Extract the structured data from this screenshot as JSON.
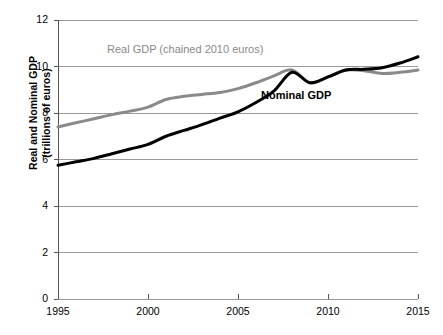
{
  "chart_data": {
    "type": "line",
    "title": "",
    "xlabel": "",
    "ylabel": "Real and Nominal GDP (trillions of euros)",
    "ylabel_line1": "Real and Nominal GDP",
    "ylabel_line2": "(trillions of euros)",
    "xlim": [
      1995,
      2015
    ],
    "ylim": [
      0,
      12
    ],
    "yticks": [
      0,
      2,
      4,
      6,
      8,
      10,
      12
    ],
    "ytick_labels": [
      "0",
      "2",
      "4",
      "6",
      "8",
      "10",
      "12"
    ],
    "xticks": [
      1995,
      2000,
      2005,
      2010,
      2015
    ],
    "xtick_labels": [
      "1995",
      "2000",
      "2005",
      "2010",
      "2015"
    ],
    "grid": "horizontal",
    "legend_position": "inline-annotations",
    "x": [
      1995,
      1996,
      1997,
      1998,
      1999,
      2000,
      2001,
      2002,
      2003,
      2004,
      2005,
      2006,
      2007,
      2008,
      2009,
      2010,
      2011,
      2012,
      2013,
      2014,
      2015
    ],
    "series": [
      {
        "name": "Real GDP (chained 2010 euros)",
        "color": "#8a8a8a",
        "width": 3.0,
        "values": [
          7.4,
          7.58,
          7.75,
          7.93,
          8.08,
          8.25,
          8.58,
          8.72,
          8.8,
          8.88,
          9.05,
          9.3,
          9.6,
          9.85,
          9.3,
          9.55,
          9.85,
          9.82,
          9.7,
          9.75,
          9.85
        ]
      },
      {
        "name": "Nominal GDP",
        "color": "#000000",
        "width": 3.0,
        "values": [
          5.75,
          5.9,
          6.05,
          6.25,
          6.45,
          6.65,
          7.0,
          7.25,
          7.5,
          7.78,
          8.05,
          8.45,
          8.95,
          9.75,
          9.3,
          9.55,
          9.85,
          9.88,
          9.95,
          10.15,
          10.42
        ]
      }
    ],
    "annotations": [
      {
        "text": "Real GDP (chained 2010 euros)",
        "series": "Real GDP (chained 2010 euros)",
        "color": "#8a8a8a",
        "bold": false
      },
      {
        "text": "Nominal GDP",
        "series": "Nominal GDP",
        "color": "#000000",
        "bold": true
      }
    ],
    "colors": {
      "real_gdp": "#8a8a8a",
      "nominal_gdp": "#000000",
      "gridline": "#9a9a9a",
      "axis": "#555555",
      "background": "#ffffff"
    }
  }
}
